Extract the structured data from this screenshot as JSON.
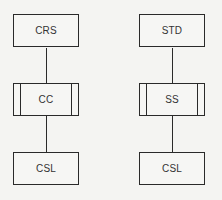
{
  "diagram": {
    "left": {
      "top": {
        "label": "CRS",
        "type": "process"
      },
      "middle": {
        "label": "CC",
        "type": "predefined-process"
      },
      "bottom": {
        "label": "CSL",
        "type": "process"
      }
    },
    "right": {
      "top": {
        "label": "STD",
        "type": "process"
      },
      "middle": {
        "label": "SS",
        "type": "predefined-process"
      },
      "bottom": {
        "label": "CSL",
        "type": "process"
      }
    },
    "connections": [
      [
        "CRS",
        "CC"
      ],
      [
        "CC",
        "CSL"
      ],
      [
        "STD",
        "SS"
      ],
      [
        "SS",
        "CSL"
      ]
    ]
  }
}
